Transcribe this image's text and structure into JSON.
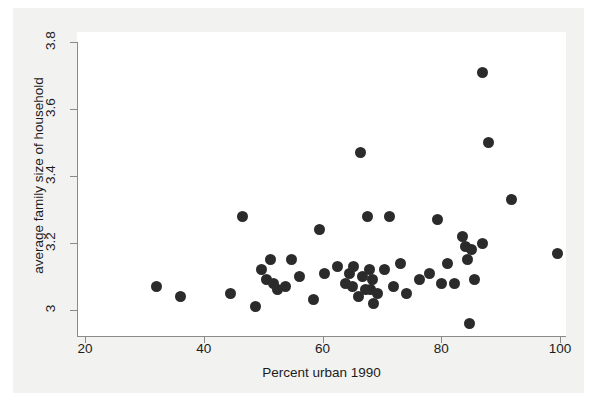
{
  "figure": {
    "background_color": "#f2f2f1",
    "plot_background_color": "#ffffff",
    "axis_color": "#8a8a8a",
    "marker_color": "#2b2b2b"
  },
  "chart_data": {
    "type": "scatter",
    "title": "",
    "xlabel": "Percent urban 1990",
    "ylabel": "average family size of household",
    "xlim": [
      20,
      100
    ],
    "ylim": [
      2.93,
      3.82
    ],
    "xticks": [
      20,
      40,
      60,
      80,
      100
    ],
    "xtick_labels": [
      "20",
      "40",
      "60",
      "80",
      "100"
    ],
    "yticks": [
      3.0,
      3.2,
      3.4,
      3.6,
      3.8
    ],
    "ytick_labels": [
      "3",
      "3.2",
      "3.4",
      "3.6",
      "3.8"
    ],
    "grid": false,
    "legend": null,
    "series": [
      {
        "name": "states",
        "marker": "circle",
        "color": "#2b2b2b",
        "points": [
          {
            "x": 32.1,
            "y": 3.07
          },
          {
            "x": 36.1,
            "y": 3.04
          },
          {
            "x": 44.5,
            "y": 3.05
          },
          {
            "x": 46.6,
            "y": 3.28
          },
          {
            "x": 48.7,
            "y": 3.01
          },
          {
            "x": 49.8,
            "y": 3.12
          },
          {
            "x": 50.5,
            "y": 3.09
          },
          {
            "x": 51.3,
            "y": 3.15
          },
          {
            "x": 51.8,
            "y": 3.08
          },
          {
            "x": 52.5,
            "y": 3.06
          },
          {
            "x": 53.8,
            "y": 3.07
          },
          {
            "x": 54.7,
            "y": 3.15
          },
          {
            "x": 56.2,
            "y": 3.1
          },
          {
            "x": 58.5,
            "y": 3.03
          },
          {
            "x": 59.5,
            "y": 3.24
          },
          {
            "x": 60.3,
            "y": 3.11
          },
          {
            "x": 62.5,
            "y": 3.13
          },
          {
            "x": 63.8,
            "y": 3.08
          },
          {
            "x": 64.5,
            "y": 3.11
          },
          {
            "x": 65.1,
            "y": 3.07
          },
          {
            "x": 65.3,
            "y": 3.13
          },
          {
            "x": 66.0,
            "y": 3.04
          },
          {
            "x": 66.4,
            "y": 3.47
          },
          {
            "x": 66.7,
            "y": 3.1
          },
          {
            "x": 67.2,
            "y": 3.06
          },
          {
            "x": 67.5,
            "y": 3.28
          },
          {
            "x": 67.9,
            "y": 3.12
          },
          {
            "x": 68.1,
            "y": 3.06
          },
          {
            "x": 68.4,
            "y": 3.09
          },
          {
            "x": 68.6,
            "y": 3.02
          },
          {
            "x": 69.3,
            "y": 3.05
          },
          {
            "x": 70.5,
            "y": 3.12
          },
          {
            "x": 71.3,
            "y": 3.28
          },
          {
            "x": 72.0,
            "y": 3.07
          },
          {
            "x": 73.1,
            "y": 3.14
          },
          {
            "x": 74.2,
            "y": 3.05
          },
          {
            "x": 76.4,
            "y": 3.09
          },
          {
            "x": 78.0,
            "y": 3.11
          },
          {
            "x": 79.3,
            "y": 3.27
          },
          {
            "x": 80.1,
            "y": 3.08
          },
          {
            "x": 81.0,
            "y": 3.14
          },
          {
            "x": 82.3,
            "y": 3.08
          },
          {
            "x": 83.6,
            "y": 3.22
          },
          {
            "x": 84.0,
            "y": 3.19
          },
          {
            "x": 84.4,
            "y": 3.15
          },
          {
            "x": 84.7,
            "y": 2.96
          },
          {
            "x": 85.1,
            "y": 3.18
          },
          {
            "x": 85.6,
            "y": 3.09
          },
          {
            "x": 86.9,
            "y": 3.2
          },
          {
            "x": 86.9,
            "y": 3.71
          },
          {
            "x": 87.9,
            "y": 3.5
          },
          {
            "x": 91.8,
            "y": 3.33
          },
          {
            "x": 99.6,
            "y": 3.17
          }
        ]
      }
    ]
  }
}
